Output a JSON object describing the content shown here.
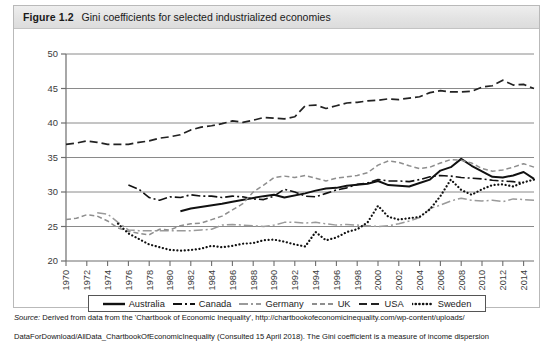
{
  "figure": {
    "number": "Figure 1.2",
    "title": "Gini coefficients for selected industrialized economies"
  },
  "source": {
    "label": "Source:",
    "line1": "  Derived from data from the 'Chartbook of Economic Inequality', http://chartbookofeconomicinequality.com/wp-content/uploads/",
    "line2": "DataForDownload/AllData_ChartbookOfEconomicInequality (Consulted 15 April 2018). The Gini coefficient is a measure of income dispersion"
  },
  "legend": {
    "items": [
      {
        "label": "Australia",
        "style": "solid",
        "color": "#111111",
        "width": 2.0
      },
      {
        "label": "Canada",
        "style": "dash-dot",
        "color": "#111111",
        "width": 1.6
      },
      {
        "label": "Germany",
        "style": "dash-dot",
        "color": "#9a9a9a",
        "width": 1.5
      },
      {
        "label": "UK",
        "style": "dashed",
        "color": "#8e8e8e",
        "width": 1.5
      },
      {
        "label": "USA",
        "style": "long-dashed",
        "color": "#222222",
        "width": 1.7
      },
      {
        "label": "Sweden",
        "style": "dotted",
        "color": "#111111",
        "width": 2.2
      }
    ]
  },
  "chart_data": {
    "type": "line",
    "title": "Gini coefficients for selected industrialized economies",
    "xlabel": "",
    "ylabel": "",
    "xlim": [
      1970,
      2015
    ],
    "ylim": [
      20,
      50
    ],
    "yticks": [
      20,
      25,
      30,
      35,
      40,
      45,
      50
    ],
    "xticks": [
      1970,
      1972,
      1974,
      1976,
      1978,
      1980,
      1982,
      1984,
      1986,
      1988,
      1990,
      1992,
      1994,
      1996,
      1998,
      2000,
      2002,
      2004,
      2006,
      2008,
      2010,
      2012,
      2014
    ],
    "grid": "horizontal",
    "legend_position": "bottom",
    "series": [
      {
        "name": "Australia",
        "points": [
          [
            1981,
            27.2
          ],
          [
            1982,
            27.6
          ],
          [
            1985,
            28.3
          ],
          [
            1986,
            28.6
          ],
          [
            1989,
            29.4
          ],
          [
            1990,
            29.6
          ],
          [
            1991,
            29.2
          ],
          [
            1993,
            29.8
          ],
          [
            1994,
            30.2
          ],
          [
            1995,
            30.5
          ],
          [
            1996,
            30.6
          ],
          [
            1997,
            30.9
          ],
          [
            1999,
            31.2
          ],
          [
            2000,
            31.6
          ],
          [
            2001,
            31.0
          ],
          [
            2003,
            30.8
          ],
          [
            2004,
            31.3
          ],
          [
            2005,
            31.8
          ],
          [
            2006,
            33.1
          ],
          [
            2007,
            33.6
          ],
          [
            2008,
            34.8
          ],
          [
            2009,
            33.8
          ],
          [
            2010,
            33.0
          ],
          [
            2011,
            32.2
          ],
          [
            2012,
            32.1
          ],
          [
            2013,
            32.4
          ],
          [
            2014,
            32.9
          ],
          [
            2015,
            31.9
          ]
        ]
      },
      {
        "name": "Canada",
        "points": [
          [
            1976,
            31.0
          ],
          [
            1977,
            30.4
          ],
          [
            1978,
            29.2
          ],
          [
            1979,
            28.8
          ],
          [
            1980,
            29.3
          ],
          [
            1981,
            29.2
          ],
          [
            1982,
            29.6
          ],
          [
            1983,
            29.4
          ],
          [
            1984,
            29.4
          ],
          [
            1985,
            29.2
          ],
          [
            1986,
            29.4
          ],
          [
            1987,
            29.3
          ],
          [
            1988,
            29.0
          ],
          [
            1989,
            28.9
          ],
          [
            1990,
            29.4
          ],
          [
            1991,
            30.4
          ],
          [
            1992,
            30.0
          ],
          [
            1993,
            29.4
          ],
          [
            1994,
            29.3
          ],
          [
            1995,
            29.8
          ],
          [
            1996,
            30.3
          ],
          [
            1997,
            30.6
          ],
          [
            1998,
            31.1
          ],
          [
            1999,
            31.3
          ],
          [
            2000,
            31.8
          ],
          [
            2001,
            31.6
          ],
          [
            2002,
            31.6
          ],
          [
            2003,
            31.5
          ],
          [
            2004,
            31.8
          ],
          [
            2005,
            32.2
          ],
          [
            2006,
            32.4
          ],
          [
            2007,
            32.3
          ],
          [
            2008,
            32.1
          ],
          [
            2009,
            32.0
          ],
          [
            2010,
            31.9
          ],
          [
            2011,
            31.7
          ],
          [
            2012,
            31.6
          ],
          [
            2013,
            31.5
          ],
          [
            2014,
            31.3
          ]
        ]
      },
      {
        "name": "Germany",
        "points": [
          [
            1973,
            27.0
          ],
          [
            1974,
            26.8
          ],
          [
            1975,
            25.6
          ],
          [
            1976,
            24.5
          ],
          [
            1977,
            24.4
          ],
          [
            1978,
            24.4
          ],
          [
            1979,
            24.4
          ],
          [
            1980,
            24.4
          ],
          [
            1981,
            24.4
          ],
          [
            1982,
            24.4
          ],
          [
            1983,
            24.5
          ],
          [
            1984,
            24.6
          ],
          [
            1985,
            25.2
          ],
          [
            1986,
            25.3
          ],
          [
            1987,
            25.2
          ],
          [
            1988,
            25.1
          ],
          [
            1989,
            25.0
          ],
          [
            1990,
            25.2
          ],
          [
            1991,
            25.6
          ],
          [
            1992,
            25.6
          ],
          [
            1993,
            25.5
          ],
          [
            1994,
            25.6
          ],
          [
            1995,
            25.4
          ],
          [
            1996,
            25.2
          ],
          [
            1997,
            25.3
          ],
          [
            1998,
            25.2
          ],
          [
            1999,
            25.1
          ],
          [
            2000,
            25.0
          ],
          [
            2001,
            25.1
          ],
          [
            2002,
            25.4
          ],
          [
            2003,
            25.8
          ],
          [
            2004,
            26.3
          ],
          [
            2005,
            27.6
          ],
          [
            2006,
            28.1
          ],
          [
            2007,
            28.7
          ],
          [
            2008,
            29.1
          ],
          [
            2009,
            28.8
          ],
          [
            2010,
            28.7
          ],
          [
            2011,
            28.8
          ],
          [
            2012,
            28.6
          ],
          [
            2013,
            29.0
          ],
          [
            2014,
            28.9
          ],
          [
            2015,
            28.8
          ]
        ]
      },
      {
        "name": "UK",
        "points": [
          [
            1970,
            26.0
          ],
          [
            1971,
            26.2
          ],
          [
            1972,
            26.7
          ],
          [
            1973,
            26.5
          ],
          [
            1974,
            25.8
          ],
          [
            1975,
            24.8
          ],
          [
            1976,
            24.3
          ],
          [
            1977,
            24.0
          ],
          [
            1978,
            23.8
          ],
          [
            1979,
            24.6
          ],
          [
            1980,
            24.5
          ],
          [
            1981,
            25.1
          ],
          [
            1982,
            25.4
          ],
          [
            1983,
            25.5
          ],
          [
            1984,
            26.0
          ],
          [
            1985,
            26.5
          ],
          [
            1986,
            27.4
          ],
          [
            1987,
            28.3
          ],
          [
            1988,
            30.0
          ],
          [
            1989,
            31.0
          ],
          [
            1990,
            32.1
          ],
          [
            1991,
            32.3
          ],
          [
            1992,
            32.1
          ],
          [
            1993,
            32.4
          ],
          [
            1994,
            32.0
          ],
          [
            1995,
            31.6
          ],
          [
            1996,
            32.0
          ],
          [
            1997,
            32.2
          ],
          [
            1998,
            32.4
          ],
          [
            1999,
            32.8
          ],
          [
            2000,
            33.9
          ],
          [
            2001,
            34.5
          ],
          [
            2002,
            34.3
          ],
          [
            2003,
            33.8
          ],
          [
            2004,
            33.4
          ],
          [
            2005,
            33.6
          ],
          [
            2006,
            34.2
          ],
          [
            2007,
            34.7
          ],
          [
            2008,
            34.6
          ],
          [
            2009,
            34.2
          ],
          [
            2010,
            33.4
          ],
          [
            2011,
            33.0
          ],
          [
            2012,
            33.2
          ],
          [
            2013,
            33.6
          ],
          [
            2014,
            34.1
          ],
          [
            2015,
            33.6
          ]
        ]
      },
      {
        "name": "USA",
        "points": [
          [
            1970,
            36.9
          ],
          [
            1971,
            37.1
          ],
          [
            1972,
            37.4
          ],
          [
            1973,
            37.2
          ],
          [
            1974,
            36.9
          ],
          [
            1975,
            36.9
          ],
          [
            1976,
            36.9
          ],
          [
            1977,
            37.2
          ],
          [
            1978,
            37.4
          ],
          [
            1979,
            37.8
          ],
          [
            1980,
            38.0
          ],
          [
            1981,
            38.3
          ],
          [
            1982,
            39.0
          ],
          [
            1983,
            39.4
          ],
          [
            1984,
            39.6
          ],
          [
            1985,
            39.9
          ],
          [
            1986,
            40.3
          ],
          [
            1987,
            40.1
          ],
          [
            1988,
            40.4
          ],
          [
            1989,
            40.8
          ],
          [
            1990,
            40.7
          ],
          [
            1991,
            40.6
          ],
          [
            1992,
            40.9
          ],
          [
            1993,
            42.5
          ],
          [
            1994,
            42.6
          ],
          [
            1995,
            42.1
          ],
          [
            1996,
            42.5
          ],
          [
            1997,
            42.9
          ],
          [
            1998,
            43.0
          ],
          [
            1999,
            43.2
          ],
          [
            2000,
            43.3
          ],
          [
            2001,
            43.5
          ],
          [
            2002,
            43.4
          ],
          [
            2003,
            43.6
          ],
          [
            2004,
            43.8
          ],
          [
            2005,
            44.4
          ],
          [
            2006,
            44.7
          ],
          [
            2007,
            44.5
          ],
          [
            2008,
            44.5
          ],
          [
            2009,
            44.6
          ],
          [
            2010,
            45.2
          ],
          [
            2011,
            45.4
          ],
          [
            2012,
            46.2
          ],
          [
            2013,
            45.5
          ],
          [
            2014,
            45.6
          ],
          [
            2015,
            45.0
          ]
        ]
      },
      {
        "name": "Sweden",
        "points": [
          [
            1975,
            25.4
          ],
          [
            1976,
            24.0
          ],
          [
            1977,
            23.2
          ],
          [
            1978,
            22.4
          ],
          [
            1979,
            22.0
          ],
          [
            1980,
            21.6
          ],
          [
            1981,
            21.5
          ],
          [
            1982,
            21.6
          ],
          [
            1983,
            21.8
          ],
          [
            1984,
            22.2
          ],
          [
            1985,
            22.0
          ],
          [
            1986,
            22.2
          ],
          [
            1987,
            22.5
          ],
          [
            1988,
            22.6
          ],
          [
            1989,
            23.0
          ],
          [
            1990,
            23.1
          ],
          [
            1991,
            22.8
          ],
          [
            1992,
            22.4
          ],
          [
            1993,
            22.1
          ],
          [
            1994,
            24.2
          ],
          [
            1995,
            23.0
          ],
          [
            1996,
            23.4
          ],
          [
            1997,
            24.2
          ],
          [
            1998,
            24.6
          ],
          [
            1999,
            25.6
          ],
          [
            2000,
            28.0
          ],
          [
            2001,
            26.4
          ],
          [
            2002,
            26.0
          ],
          [
            2003,
            26.2
          ],
          [
            2004,
            26.4
          ],
          [
            2005,
            27.5
          ],
          [
            2006,
            29.4
          ],
          [
            2007,
            31.8
          ],
          [
            2008,
            30.3
          ],
          [
            2009,
            29.6
          ],
          [
            2010,
            30.4
          ],
          [
            2011,
            31.0
          ],
          [
            2012,
            31.1
          ],
          [
            2013,
            30.8
          ],
          [
            2014,
            31.4
          ],
          [
            2015,
            31.8
          ]
        ]
      }
    ]
  }
}
